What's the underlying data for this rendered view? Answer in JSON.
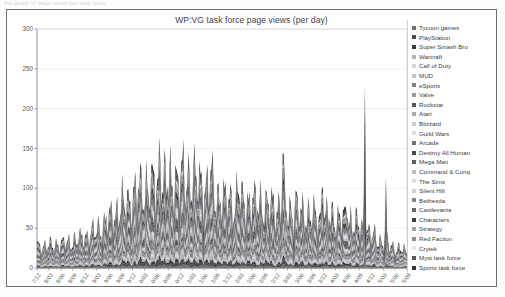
{
  "window": {
    "top_strip_text": "the graph of page views per task force"
  },
  "chart_data": {
    "type": "area",
    "stacked": true,
    "title": "WP:VG task force page views (per day)",
    "xlabel": "",
    "ylabel": "",
    "ylim": [
      0,
      300
    ],
    "yticks": [
      0,
      50,
      100,
      150,
      200,
      250,
      300
    ],
    "grid": true,
    "legend_position": "right",
    "x_tick_labels": [
      "7/12",
      "8/03",
      "8/06",
      "8/09",
      "8/12",
      "9/03",
      "9/06",
      "9/09",
      "9/12",
      "0/03",
      "0/06",
      "0/09",
      "0/12",
      "1/03",
      "1/06",
      "1/09",
      "1/12",
      "2/03",
      "2/06",
      "2/09",
      "2/12",
      "3/03",
      "3/06",
      "3/09",
      "3/12",
      "4/03",
      "4/06",
      "4/09",
      "4/12",
      "5/03",
      "5/06",
      "5/09"
    ],
    "series": [
      {
        "name": "Tycoon games",
        "color": "#6f6f74",
        "mean": 1.2
      },
      {
        "name": "PlayStation",
        "color": "#4a4a4f",
        "mean": 1.6
      },
      {
        "name": "Super Smash Bro",
        "color": "#3a3a3f",
        "mean": 1.5
      },
      {
        "name": "Warcraft",
        "color": "#b4b4b9",
        "mean": 1.7
      },
      {
        "name": "Call of Duty",
        "color": "#d6d6db",
        "mean": 1.4
      },
      {
        "name": "MUD",
        "color": "#c2c2c7",
        "mean": 1.3
      },
      {
        "name": "eSports",
        "color": "#7d7d82",
        "mean": 1.9
      },
      {
        "name": "Valve",
        "color": "#9a9a9f",
        "mean": 1.6
      },
      {
        "name": "Rockstar",
        "color": "#545459",
        "mean": 1.8
      },
      {
        "name": "Atari",
        "color": "#a8a8ad",
        "mean": 1.5
      },
      {
        "name": "Blizzard",
        "color": "#cacacf",
        "mean": 1.7
      },
      {
        "name": "Guild Wars",
        "color": "#dcdce1",
        "mean": 1.4
      },
      {
        "name": "Arcade",
        "color": "#717176",
        "mean": 2.1
      },
      {
        "name": "Destroy All Human",
        "color": "#47474c",
        "mean": 1.9
      },
      {
        "name": "Mega Man",
        "color": "#5e5e63",
        "mean": 2.4
      },
      {
        "name": "Command & Conq",
        "color": "#bdbdc2",
        "mean": 2.2
      },
      {
        "name": "The Sims",
        "color": "#e0e0e5",
        "mean": 2.0
      },
      {
        "name": "Silent Hill",
        "color": "#d0d0d5",
        "mean": 1.8
      },
      {
        "name": "Bethesda",
        "color": "#858589",
        "mean": 2.6
      },
      {
        "name": "Castlevania",
        "color": "#66666b",
        "mean": 2.3
      },
      {
        "name": "Characters",
        "color": "#3f3f44",
        "mean": 2.7
      },
      {
        "name": "Strategy",
        "color": "#a0a0a5",
        "mean": 2.4
      },
      {
        "name": "Red Faction",
        "color": "#8e8e93",
        "mean": 2.1
      },
      {
        "name": "Crytek",
        "color": "#e6e6eb",
        "mean": 1.6
      },
      {
        "name": "Myst task force",
        "color": "#5a5a5f",
        "mean": 2.8
      },
      {
        "name": "Sports task force",
        "color": "#333338",
        "mean": 3.0
      }
    ]
  }
}
